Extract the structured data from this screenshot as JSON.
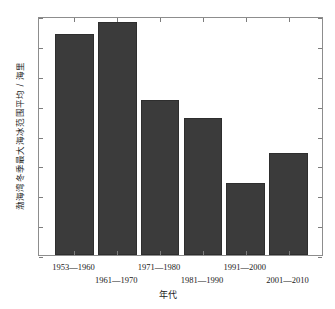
{
  "chart_data": {
    "type": "bar",
    "title": "",
    "subtitle": "",
    "xlabel": "年代",
    "ylabel": "渤海湾冬季最大海冰范围平均 / 海里",
    "categories": [
      "1953—1960",
      "1961—1970",
      "1971—1980",
      "1981—1990",
      "1991—2000",
      "2001—2010"
    ],
    "values": [
      37,
      39,
      26,
      23,
      12,
      17
    ],
    "series": [
      {
        "name": "渤海湾冬季最大海冰范围平均",
        "values": [
          37,
          39,
          26,
          23,
          12,
          17
        ]
      }
    ],
    "ylim": [
      0,
      40
    ],
    "ytick_labels": [
      "0",
      "5",
      "10",
      "15",
      "20",
      "25",
      "30",
      "35",
      "40"
    ],
    "ytick_values": [
      0,
      5,
      10,
      15,
      20,
      25,
      30,
      35,
      40
    ],
    "grid": false,
    "legend": "none",
    "bar_color": "#3b3b3b",
    "axis_color": "#8d8d8d",
    "background_color": "#ffffff"
  },
  "axes": {
    "y_title": "渤海湾冬季最大海冰范围平均 / 海里",
    "x_title": "年代"
  }
}
